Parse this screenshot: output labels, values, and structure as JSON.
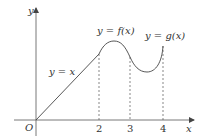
{
  "diagram": {
    "axes": {
      "x_label": "x",
      "y_label": "y",
      "origin_label": "O",
      "ticks": [
        "2",
        "3",
        "4"
      ]
    },
    "curves": {
      "line_label": "y = x",
      "f_label": "y = f(x)",
      "g_label": "y = g(x)"
    },
    "colors": {
      "stroke": "#444444",
      "dashed": "#555555",
      "text": "#333333"
    }
  }
}
